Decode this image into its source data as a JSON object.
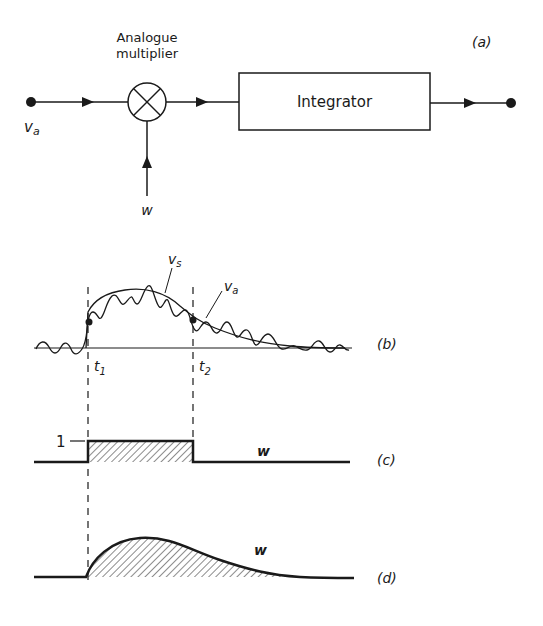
{
  "panel_a": {
    "label": "(a)",
    "multiplier_label_line1": "Analogue",
    "multiplier_label_line2": "multiplier",
    "integrator_label": "Integrator",
    "input_label": "v",
    "input_sub": "a",
    "weight_label": "w"
  },
  "panel_b": {
    "label": "(b)",
    "vs_label": "v",
    "vs_sub": "s",
    "va_label": "v",
    "va_sub": "a",
    "t1_label": "t",
    "t1_sub": "1",
    "t2_label": "t",
    "t2_sub": "2"
  },
  "panel_c": {
    "label": "(c)",
    "level_label": "1",
    "curve_label": "w"
  },
  "panel_d": {
    "label": "(d)",
    "curve_label": "w"
  },
  "colors": {
    "ink": "#1a1a1a",
    "background": "#ffffff"
  }
}
